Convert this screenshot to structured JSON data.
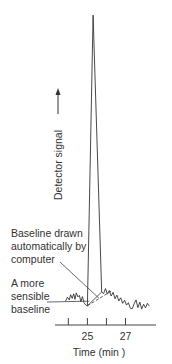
{
  "chart_data": {
    "type": "line",
    "title": "",
    "xlabel": "Time (min )",
    "ylabel": "Detector signal",
    "ylabel_arrow": "up",
    "x_ticks": [
      {
        "value": 24,
        "label": ""
      },
      {
        "value": 25,
        "label": "25"
      },
      {
        "value": 26,
        "label": ""
      },
      {
        "value": 27,
        "label": "27"
      }
    ],
    "xlim": [
      23.3,
      28.6
    ],
    "ylim": [
      0,
      100
    ],
    "grid": false,
    "legend": "none",
    "series": [
      {
        "name": "chromatogram",
        "style": "solid",
        "points": [
          [
            23.85,
            5.5
          ],
          [
            23.95,
            6.8
          ],
          [
            24.05,
            5.9
          ],
          [
            24.12,
            7.6
          ],
          [
            24.2,
            6.4
          ],
          [
            24.28,
            7.9
          ],
          [
            24.35,
            6.1
          ],
          [
            24.42,
            8.2
          ],
          [
            24.5,
            6.9
          ],
          [
            24.58,
            7.4
          ],
          [
            24.66,
            5.3
          ],
          [
            24.74,
            7.0
          ],
          [
            24.82,
            5.0
          ],
          [
            24.9,
            4.3
          ],
          [
            25.0,
            4.0
          ],
          [
            25.3,
            99.0
          ],
          [
            25.75,
            8.5
          ],
          [
            25.85,
            8.0
          ],
          [
            25.95,
            9.6
          ],
          [
            26.05,
            7.8
          ],
          [
            26.15,
            9.0
          ],
          [
            26.25,
            7.2
          ],
          [
            26.35,
            8.4
          ],
          [
            26.45,
            6.3
          ],
          [
            26.55,
            7.5
          ],
          [
            26.65,
            5.6
          ],
          [
            26.75,
            6.6
          ],
          [
            26.85,
            4.8
          ],
          [
            26.95,
            5.8
          ],
          [
            27.05,
            4.2
          ],
          [
            27.15,
            5.0
          ],
          [
            27.25,
            3.2
          ],
          [
            27.35,
            3.0
          ],
          [
            27.45,
            4.6
          ],
          [
            27.55,
            5.9
          ],
          [
            27.65,
            3.4
          ],
          [
            27.75,
            5.2
          ],
          [
            27.85,
            2.9
          ],
          [
            27.95,
            4.5
          ],
          [
            28.05,
            3.3
          ],
          [
            28.15,
            4.8
          ],
          [
            28.25,
            3.9
          ]
        ]
      },
      {
        "name": "Baseline drawn automatically by computer",
        "style": "solid",
        "points": [
          [
            25.0,
            4.0
          ],
          [
            25.75,
            8.5
          ]
        ]
      },
      {
        "name": "A more sensible baseline",
        "style": "dashed",
        "points": [
          [
            25.0,
            4.0
          ],
          [
            26.3,
            9.0
          ]
        ]
      }
    ],
    "annotations": [
      {
        "text_lines": [
          "Baseline drawn",
          "automatically by",
          "computer"
        ],
        "points_to": [
          25.6,
          6.5
        ]
      },
      {
        "text_lines": [
          "A more",
          "sensible",
          "baseline"
        ],
        "points_to": [
          25.1,
          5.5
        ]
      }
    ]
  }
}
